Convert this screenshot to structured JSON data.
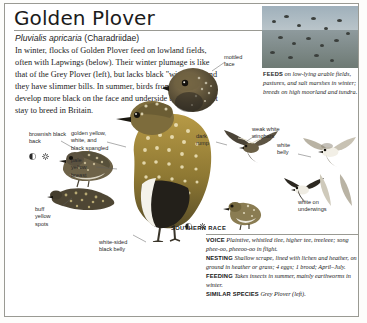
{
  "page": {
    "title": "Golden Plover",
    "scientific_name": "Pluvialis apricaria",
    "family": "(Charadriidae)",
    "intro": "In winter, flocks of Golden Plover feed on lowland fields, often with Lapwings (below). Their winter plumage is like that of the Grey Plover (left), but lacks black \"wingpits\", and they have slimmer bills. In summer, birds from the north develop more black on the face and underside than those that stay to breed in Britain."
  },
  "photo_caption": {
    "keyword": "FEEDS",
    "text": "on low-lying arable fields, pastures, and salt marshes in winter; breeds on high moorland and tundra."
  },
  "labels": {
    "mottled_face": "mottled\nface",
    "brownish_black_back": "brownish black\nback",
    "golden_spangled": "golden yellow,\nwhite, and\nblack spangled",
    "pale_yellow_breast": "pale\nyellow\nbreast",
    "buff_yellow_spots": "buff\nyellow\nspots",
    "white_sided_black_belly": "white-sided\nblack belly",
    "dark_rump": "dark\nrump",
    "weak_white_wingbars": "weak white\nwingbars",
    "white_belly": "white\nbelly",
    "white_on_underwings": "white on\nunderwings",
    "southern_race": "SOUTHERN RACE"
  },
  "info_box": [
    {
      "key": "VOICE",
      "value": "Plaintive, whistled tlee, higher tee, treeleee; song phee-oo, pheeoo-oo in flight."
    },
    {
      "key": "NESTING",
      "value": "Shallow scrape, lined with lichen and heather, on ground in heather or grass; 4 eggs; 1 brood; April–July."
    },
    {
      "key": "FEEDING",
      "value": "Takes insects in summer, mainly earthworms in winter."
    },
    {
      "key": "SIMILAR SPECIES",
      "value": "Grey Plover (left)."
    }
  ],
  "colors": {
    "paper": "#ffffff",
    "rule": "#9a9a93",
    "text": "#1a1a1a",
    "bird_gold": "#c9a33c",
    "bird_dark": "#3a3428"
  }
}
